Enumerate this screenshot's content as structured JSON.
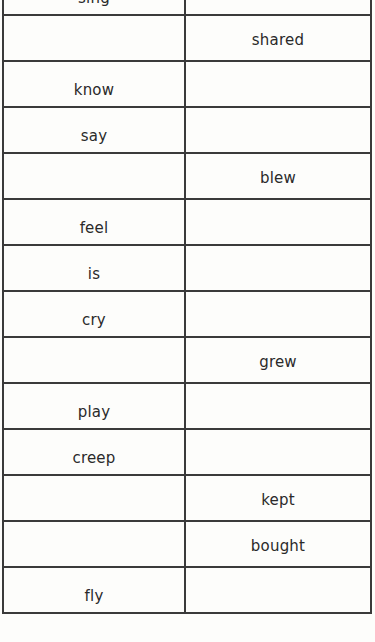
{
  "worksheet": {
    "columns": [
      "present",
      "past"
    ],
    "rows": [
      {
        "present": "sing",
        "past": ""
      },
      {
        "present": "",
        "past": "shared"
      },
      {
        "present": "know",
        "past": ""
      },
      {
        "present": "say",
        "past": ""
      },
      {
        "present": "",
        "past": "blew"
      },
      {
        "present": "feel",
        "past": ""
      },
      {
        "present": "is",
        "past": ""
      },
      {
        "present": "cry",
        "past": ""
      },
      {
        "present": "",
        "past": "grew"
      },
      {
        "present": "play",
        "past": ""
      },
      {
        "present": "creep",
        "past": ""
      },
      {
        "present": "",
        "past": "kept"
      },
      {
        "present": "",
        "past": "bought"
      },
      {
        "present": "fly",
        "past": ""
      }
    ]
  }
}
